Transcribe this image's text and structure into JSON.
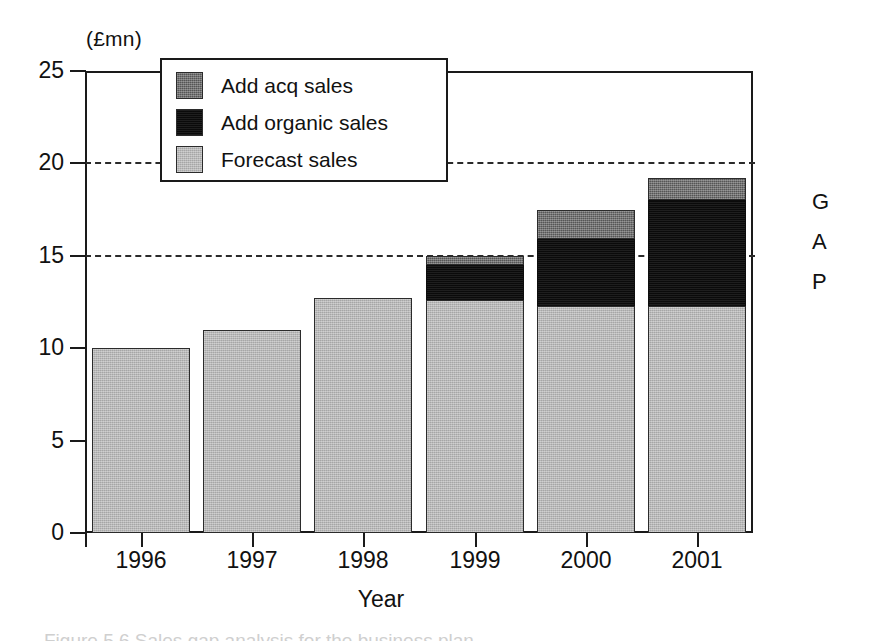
{
  "figure": {
    "unit_label": "(£mn)",
    "gap_annotation": [
      "G",
      "A",
      "P"
    ],
    "caption_partial": "Figure 5.6  Sales gap analysis for the business plan"
  },
  "chart_data": {
    "type": "bar",
    "stacked": true,
    "title": "",
    "subtitle": "",
    "xlabel": "Year",
    "ylabel": "(£mn)",
    "categories": [
      "1996",
      "1997",
      "1998",
      "1999",
      "2000",
      "2001"
    ],
    "ylim": [
      0,
      25
    ],
    "yticks": [
      0,
      5,
      10,
      15,
      20,
      25
    ],
    "ytick_labels": [
      "0",
      "5",
      "10",
      "15",
      "20",
      "25"
    ],
    "gridlines": [
      15,
      20
    ],
    "grid": "dashed horizontal at 15 and 20",
    "legend_position": "top-left inside plot",
    "series": [
      {
        "name": "Forecast sales",
        "color": "#b6b6b6",
        "values": [
          10.0,
          11.0,
          12.7,
          12.6,
          12.3,
          12.3
        ]
      },
      {
        "name": "Add organic sales",
        "color": "#0d0d0d",
        "values": [
          0,
          0,
          0,
          1.9,
          3.6,
          5.7
        ]
      },
      {
        "name": "Add acq sales",
        "color": "#5e5e5e",
        "values": [
          0,
          0,
          0,
          0.5,
          1.6,
          1.2
        ]
      }
    ],
    "totals": [
      10.0,
      11.0,
      12.7,
      15.0,
      17.5,
      19.2
    ],
    "annotations": [
      "G",
      "A",
      "P"
    ]
  },
  "legend": {
    "items": [
      {
        "label": "Add acq sales",
        "color": "#5e5e5e"
      },
      {
        "label": "Add organic sales",
        "color": "#0d0d0d"
      },
      {
        "label": "Forecast sales",
        "color": "#b6b6b6"
      }
    ]
  },
  "colors": {
    "axis": "#1a1a1a",
    "background": "#ffffff",
    "forecast": "#b6b6b6",
    "organic": "#0d0d0d",
    "acq": "#5e5e5e"
  }
}
